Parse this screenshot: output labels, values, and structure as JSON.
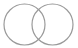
{
  "diagram": {
    "type": "venn",
    "circles": [
      {
        "name": "left",
        "cx": 24.5,
        "cy": 24.5,
        "r": 20.5
      },
      {
        "name": "right",
        "cx": 52.5,
        "cy": 24.5,
        "r": 20.5
      }
    ],
    "stroke_color": "#9a9a9a",
    "background": "#ffffff"
  }
}
